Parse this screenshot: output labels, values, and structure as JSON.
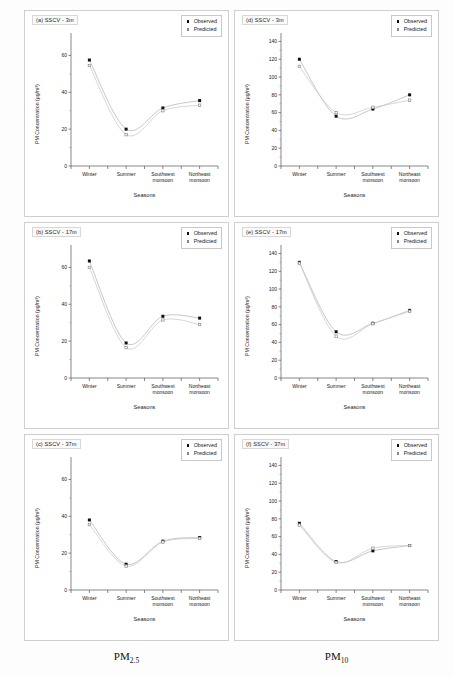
{
  "figure": {
    "captions": [
      {
        "base": "PM",
        "sub": "2.5"
      },
      {
        "base": "PM",
        "sub": "10"
      }
    ]
  },
  "legend": {
    "observed_label": "Observed",
    "predicted_label": "Predicted",
    "observed_color": "#111111",
    "predicted_color": "#8a8a8a"
  },
  "axes": {
    "xlabel": "Seasons",
    "ylabel": "PM Concentration (µg/m³)",
    "categories": [
      "Winter",
      "Summer",
      "Southwest\nmonsoon",
      "Northeast\nmonsoon"
    ]
  },
  "chart_data": [
    {
      "id": "a",
      "type": "scatter",
      "title": "(a) SSCV - 3m",
      "pollutant": "PM2.5",
      "height": "3m",
      "categories": [
        "Winter",
        "Summer",
        "Southwest monsoon",
        "Northeast monsoon"
      ],
      "series": [
        {
          "name": "Observed",
          "values": [
            57.5,
            20.0,
            31.5,
            35.5
          ]
        },
        {
          "name": "Predicted",
          "values": [
            54.5,
            17.0,
            30.0,
            33.0
          ]
        }
      ],
      "xlabel": "Seasons",
      "ylabel": "PM Concentration (µg/m³)",
      "ylim": [
        0,
        70
      ],
      "yticks": [
        0,
        20,
        40,
        60
      ],
      "grid": false,
      "legend_position": "top-right"
    },
    {
      "id": "b",
      "type": "scatter",
      "title": "(b) SSCV - 17m",
      "pollutant": "PM2.5",
      "height": "17m",
      "categories": [
        "Winter",
        "Summer",
        "Southwest monsoon",
        "Northeast monsoon"
      ],
      "series": [
        {
          "name": "Observed",
          "values": [
            63.5,
            19.0,
            33.5,
            32.5
          ]
        },
        {
          "name": "Predicted",
          "values": [
            60.0,
            16.5,
            31.5,
            29.0
          ]
        }
      ],
      "xlabel": "Seasons",
      "ylabel": "PM Concentration (µg/m³)",
      "ylim": [
        0,
        70
      ],
      "yticks": [
        0,
        20,
        40,
        60
      ],
      "grid": false,
      "legend_position": "top-right"
    },
    {
      "id": "c",
      "type": "scatter",
      "title": "(c) SSCV - 37m",
      "pollutant": "PM2.5",
      "height": "37m",
      "categories": [
        "Winter",
        "Summer",
        "Southwest monsoon",
        "Northeast monsoon"
      ],
      "series": [
        {
          "name": "Observed",
          "values": [
            38.0,
            14.0,
            26.5,
            28.5
          ]
        },
        {
          "name": "Predicted",
          "values": [
            35.5,
            13.0,
            26.0,
            28.0
          ]
        }
      ],
      "xlabel": "Seasons",
      "ylabel": "PM Concentration (µg/m³)",
      "ylim": [
        0,
        70
      ],
      "yticks": [
        0,
        20,
        40,
        60
      ],
      "grid": false,
      "legend_position": "top-right"
    },
    {
      "id": "d",
      "type": "scatter",
      "title": "(d) SSCV - 3m",
      "pollutant": "PM10",
      "height": "3m",
      "categories": [
        "Winter",
        "Summer",
        "Southwest monsoon",
        "Northeast monsoon"
      ],
      "series": [
        {
          "name": "Observed",
          "values": [
            120.0,
            56.0,
            64.0,
            80.0
          ]
        },
        {
          "name": "Predicted",
          "values": [
            112.0,
            60.0,
            66.0,
            74.0
          ]
        }
      ],
      "xlabel": "Seasons",
      "ylabel": "PM Concentration (µg/m³)",
      "ylim": [
        0,
        145
      ],
      "yticks": [
        0,
        20,
        40,
        60,
        80,
        100,
        120,
        140
      ],
      "grid": false,
      "legend_position": "top-right"
    },
    {
      "id": "e",
      "type": "scatter",
      "title": "(e) SSCV - 17m",
      "pollutant": "PM10",
      "height": "17m",
      "categories": [
        "Winter",
        "Summer",
        "Southwest monsoon",
        "Northeast monsoon"
      ],
      "series": [
        {
          "name": "Observed",
          "values": [
            130.0,
            52.0,
            61.5,
            76.0
          ]
        },
        {
          "name": "Predicted",
          "values": [
            129.0,
            47.0,
            61.0,
            75.0
          ]
        }
      ],
      "xlabel": "Seasons",
      "ylabel": "PM Concentration (µg/m³)",
      "ylim": [
        0,
        145
      ],
      "yticks": [
        0,
        20,
        40,
        60,
        80,
        100,
        120,
        140
      ],
      "grid": false,
      "legend_position": "top-right"
    },
    {
      "id": "f",
      "type": "scatter",
      "title": "(f) SSCV - 37m",
      "pollutant": "PM10",
      "height": "37m",
      "categories": [
        "Winter",
        "Summer",
        "Southwest monsoon",
        "Northeast monsoon"
      ],
      "series": [
        {
          "name": "Observed",
          "values": [
            75.0,
            32.0,
            44.0,
            50.0
          ]
        },
        {
          "name": "Predicted",
          "values": [
            73.0,
            31.0,
            47.0,
            50.0
          ]
        }
      ],
      "xlabel": "Seasons",
      "ylabel": "PM Concentration (µg/m³)",
      "ylim": [
        0,
        145
      ],
      "yticks": [
        0,
        20,
        40,
        60,
        80,
        100,
        120,
        140
      ],
      "grid": false,
      "legend_position": "top-right"
    }
  ]
}
